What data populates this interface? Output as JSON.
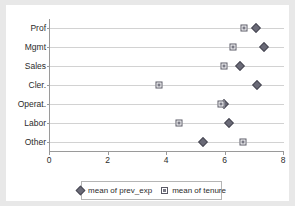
{
  "chart_data": {
    "type": "scatter",
    "title": "",
    "xlabel": "",
    "ylabel": "",
    "xlim": [
      0,
      8
    ],
    "xticks": [
      0,
      2,
      4,
      6,
      8
    ],
    "xticklabels": [
      "0",
      "2",
      "4",
      "6",
      "8"
    ],
    "categories": [
      "Prof",
      "Mgmt",
      "Sales",
      "Cler.",
      "Operat.",
      "Labor",
      "Other"
    ],
    "grid": "horizontal",
    "legend_position": "bottom",
    "series": [
      {
        "name": "mean of prev_exp",
        "marker": "diamond-filled",
        "color": "#6b6b78",
        "values": [
          7.05,
          7.3,
          6.5,
          7.07,
          5.95,
          6.12,
          5.23
        ]
      },
      {
        "name": "mean of tenure",
        "marker": "square-outlined",
        "color": "#7a7a86",
        "values": [
          6.62,
          6.25,
          5.95,
          3.72,
          5.85,
          4.4,
          6.6
        ]
      }
    ]
  },
  "legend": {
    "entries": [
      {
        "label": "mean of prev_exp",
        "marker": "diamond-icon"
      },
      {
        "label": "mean of tenure",
        "marker": "square-icon"
      }
    ]
  },
  "axes": {
    "y_labels": [
      "Prof",
      "Mgmt",
      "Sales",
      "Cler.",
      "Operat.",
      "Labor",
      "Other"
    ],
    "x_labels": [
      "0",
      "2",
      "4",
      "6",
      "8"
    ]
  }
}
